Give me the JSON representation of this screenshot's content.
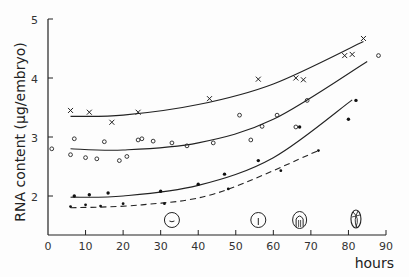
{
  "chart_data": {
    "type": "scatter",
    "title": "",
    "xlabel": "hours",
    "ylabel": "RNA content (µg/embryo)",
    "xlim": [
      0,
      90
    ],
    "ylim": [
      1.35,
      5
    ],
    "x_ticks": [
      0,
      10,
      20,
      30,
      40,
      50,
      60,
      70,
      80,
      90
    ],
    "y_ticks": [
      2,
      3,
      4,
      5
    ],
    "grid": false,
    "legend": "none",
    "series": [
      {
        "name": "crosses (x)",
        "marker": "x",
        "line": "solid",
        "points": [
          [
            6,
            3.45
          ],
          [
            11,
            3.42
          ],
          [
            17,
            3.25
          ],
          [
            24,
            3.42
          ],
          [
            43,
            3.65
          ],
          [
            56,
            3.98
          ],
          [
            66,
            4.0
          ],
          [
            68,
            3.97
          ],
          [
            79,
            4.38
          ],
          [
            81,
            4.4
          ],
          [
            84,
            4.67
          ]
        ],
        "fit": [
          [
            6,
            3.35
          ],
          [
            20,
            3.37
          ],
          [
            40,
            3.55
          ],
          [
            60,
            3.9
          ],
          [
            84,
            4.62
          ]
        ]
      },
      {
        "name": "open circles (o)",
        "marker": "o",
        "line": "solid",
        "points": [
          [
            1,
            2.8
          ],
          [
            6,
            2.7
          ],
          [
            7,
            2.97
          ],
          [
            10,
            2.65
          ],
          [
            13,
            2.63
          ],
          [
            15,
            2.92
          ],
          [
            19,
            2.6
          ],
          [
            21,
            2.67
          ],
          [
            24,
            2.95
          ],
          [
            25,
            2.97
          ],
          [
            28,
            2.93
          ],
          [
            33,
            2.9
          ],
          [
            37,
            2.85
          ],
          [
            44,
            2.9
          ],
          [
            51,
            3.37
          ],
          [
            54,
            2.95
          ],
          [
            57,
            3.18
          ],
          [
            61,
            3.37
          ],
          [
            66,
            3.17
          ],
          [
            69,
            3.62
          ],
          [
            88,
            4.38
          ]
        ],
        "fit": [
          [
            6,
            2.8
          ],
          [
            20,
            2.78
          ],
          [
            40,
            2.9
          ],
          [
            60,
            3.3
          ],
          [
            85,
            4.28
          ]
        ]
      },
      {
        "name": "filled dots (•)",
        "marker": "•",
        "line": "solid",
        "points": [
          [
            7,
            2.0
          ],
          [
            11,
            2.02
          ],
          [
            16,
            2.05
          ],
          [
            30,
            2.08
          ],
          [
            40,
            2.2
          ],
          [
            47,
            2.37
          ],
          [
            56,
            2.6
          ],
          [
            67,
            3.17
          ],
          [
            80,
            3.3
          ],
          [
            82,
            3.62
          ]
        ],
        "fit": [
          [
            6,
            1.98
          ],
          [
            20,
            2.0
          ],
          [
            40,
            2.18
          ],
          [
            60,
            2.65
          ],
          [
            81,
            3.63
          ]
        ]
      },
      {
        "name": "small dots (dashed)",
        "marker": "·",
        "line": "dashed",
        "points": [
          [
            6,
            1.82
          ],
          [
            10,
            1.85
          ],
          [
            14,
            1.83
          ],
          [
            20,
            1.87
          ],
          [
            31,
            1.87
          ],
          [
            48,
            2.12
          ],
          [
            62,
            2.43
          ],
          [
            72,
            2.77
          ]
        ],
        "fit": [
          [
            6,
            1.8
          ],
          [
            25,
            1.85
          ],
          [
            45,
            2.05
          ],
          [
            72,
            2.77
          ]
        ]
      }
    ],
    "annotations": [
      {
        "type": "embryo-stage-glyph",
        "x": 33,
        "label": "stage-1"
      },
      {
        "type": "embryo-stage-glyph",
        "x": 56,
        "label": "stage-2"
      },
      {
        "type": "embryo-stage-glyph",
        "x": 67,
        "label": "stage-3"
      },
      {
        "type": "embryo-stage-glyph",
        "x": 82,
        "label": "stage-4"
      }
    ]
  },
  "axes": {
    "xlabel": "hours",
    "ylabel": "RNA content (µg/embryo)",
    "x_tick_labels": [
      "0",
      "10",
      "20",
      "30",
      "40",
      "50",
      "60",
      "70",
      "80",
      "90"
    ],
    "y_tick_labels": [
      "2",
      "3",
      "4",
      "5"
    ]
  }
}
